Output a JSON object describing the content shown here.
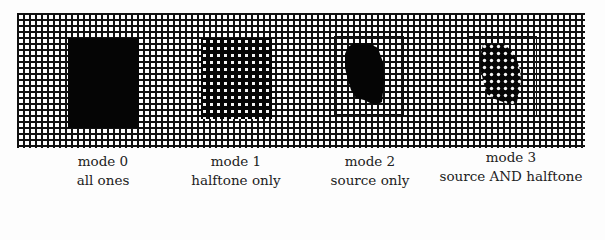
{
  "figure": {
    "background": "grid",
    "panels": [
      {
        "id": "mode0",
        "line1": "mode 0",
        "line2": "all ones",
        "fill": "solid",
        "frame": false
      },
      {
        "id": "mode1",
        "line1": "mode 1",
        "line2": "halftone only",
        "fill": "halftone",
        "frame": false
      },
      {
        "id": "mode2",
        "line1": "mode 2",
        "line2": "source only",
        "fill": "solid-blob",
        "frame": true
      },
      {
        "id": "mode3",
        "line1": "mode 3",
        "line2": "source AND halftone",
        "fill": "halftone-blob",
        "frame": true
      }
    ]
  },
  "colors": {
    "ink": "#050505",
    "paper": "#fdfdfd"
  }
}
